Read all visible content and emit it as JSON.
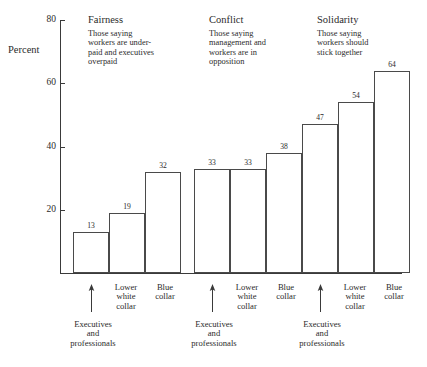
{
  "chart_data": {
    "type": "bar",
    "title": "",
    "xlabel": "",
    "ylabel": "Percent",
    "ylim": [
      0,
      80
    ],
    "ytick_values": [
      20,
      40,
      60,
      80
    ],
    "ytick_labels": [
      "20",
      "40",
      "60",
      "80"
    ],
    "grid": false,
    "legend": "none",
    "categories": [
      "Executives and professionals",
      "Lower white collar",
      "Blue collar"
    ],
    "category_short_labels": [
      "Executives\nand\nprofessionals",
      "Lower\nwhite\ncollar",
      "Blue\ncollar"
    ],
    "groups": [
      {
        "name": "Fairness",
        "description": "Those saying workers are under-paid and executives overpaid",
        "values": [
          13,
          19,
          32
        ]
      },
      {
        "name": "Conflict",
        "description": "Those saying management and workers are in opposition",
        "values": [
          33,
          33,
          38
        ]
      },
      {
        "name": "Solidarity",
        "description": "Those saying workers should stick together",
        "values": [
          47,
          54,
          64
        ]
      }
    ],
    "series": [
      {
        "name": "Executives and professionals",
        "values": [
          13,
          33,
          47
        ]
      },
      {
        "name": "Lower white collar",
        "values": [
          19,
          33,
          54
        ]
      },
      {
        "name": "Blue collar",
        "values": [
          32,
          38,
          64
        ]
      }
    ],
    "bar_fill_color": "#ffffff",
    "bar_stroke_color": "#4a4a4a",
    "axis_color": "#3a3a3a",
    "text_color": "#2b2b2b"
  },
  "axis": {
    "y_title": "Percent",
    "ticks": [
      "20",
      "40",
      "60",
      "80"
    ]
  },
  "groups": [
    {
      "title": "Fairness",
      "sub_line1": "Those saying",
      "sub_line2": "workers are under-",
      "sub_line3": "paid and executives",
      "sub_line4": "overpaid",
      "values": [
        "13",
        "19",
        "32"
      ]
    },
    {
      "title": "Conflict",
      "sub_line1": "Those saying",
      "sub_line2": "management and",
      "sub_line3": "workers are in",
      "sub_line4": "opposition",
      "values": [
        "33",
        "33",
        "38"
      ]
    },
    {
      "title": "Solidarity",
      "sub_line1": "Those saying",
      "sub_line2": "workers should",
      "sub_line3": "stick together",
      "sub_line4": "",
      "values": [
        "47",
        "54",
        "64"
      ]
    }
  ],
  "category_labels": {
    "lower_white_collar": "Lower\nwhite\ncollar",
    "blue_collar": "Blue\ncollar",
    "executives_l1": "Executives",
    "executives_l2": "and",
    "executives_l3": "professionals",
    "lower_l1": "Lower",
    "lower_l2": "white",
    "lower_l3": "collar",
    "blue_l1": "Blue",
    "blue_l2": "collar"
  }
}
